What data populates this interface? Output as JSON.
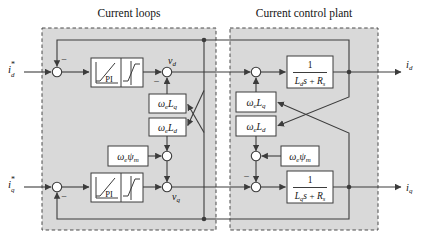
{
  "titles": {
    "left": "Current loops",
    "right": "Current control plant"
  },
  "colors": {
    "canvas_bg": "#ffffff",
    "box_fill": "#d9d9d9",
    "box_border": "#4a4a4a",
    "line": "#3c3c3c",
    "block_fill": "#ffffff",
    "block_border": "#3c3c3c",
    "text": "#141414"
  },
  "signs": {
    "minus": "−"
  },
  "inputs": {
    "id_ref": {
      "base": "i",
      "sup": "*",
      "sub": "d"
    },
    "iq_ref": {
      "base": "i",
      "sup": "*",
      "sub": "q"
    }
  },
  "outputs": {
    "id": {
      "base": "i",
      "sub": "d"
    },
    "iq": {
      "base": "i",
      "sub": "q"
    }
  },
  "voltages": {
    "vd": {
      "base": "v",
      "sub": "d"
    },
    "vq": {
      "base": "v",
      "sub": "q"
    }
  },
  "controller": {
    "pi_label": "PI"
  },
  "gain_blocks": {
    "weLq": {
      "b1": "ω",
      "s1": "e",
      "b2": "L",
      "s2": "q"
    },
    "weLd": {
      "b1": "ω",
      "s1": "e",
      "b2": "L",
      "s2": "d"
    },
    "wepsi": {
      "b1": "ω",
      "s1": "e",
      "b2": "ψ",
      "s2": "m"
    }
  },
  "plant_blocks": {
    "d": {
      "num": "1",
      "den": {
        "b1": "L",
        "s1": "d",
        "b2": "s",
        "op": "+",
        "b3": "R",
        "s3": "s"
      }
    },
    "q": {
      "num": "1",
      "den": {
        "b1": "L",
        "s1": "q",
        "b2": "s",
        "op": "+",
        "b3": "R",
        "s3": "s"
      }
    }
  }
}
